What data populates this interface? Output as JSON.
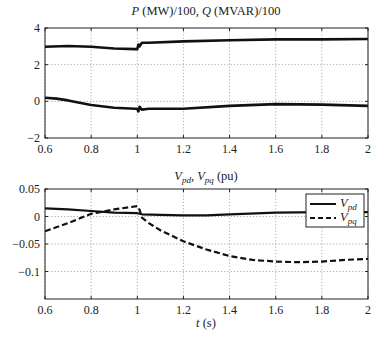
{
  "chart_data": [
    {
      "type": "line",
      "title": "P (MW)/100, Q (MVAR)/100",
      "title_parts": {
        "p": "P",
        "p_rest": " (MW)/100, ",
        "q": "Q",
        "q_rest": " (MVAR)/100"
      },
      "xlabel": "",
      "ylabel": "",
      "xlim": [
        0.6,
        2
      ],
      "ylim": [
        -2,
        4
      ],
      "xticks": [
        "0.6",
        "0.8",
        "1",
        "1.2",
        "1.4",
        "1.6",
        "1.8",
        "2"
      ],
      "yticks": [
        "4",
        "2",
        "0",
        "−2"
      ],
      "grid": true,
      "legend": null,
      "series": [
        {
          "name": "P",
          "style": "solid",
          "x": [
            0.6,
            0.7,
            0.8,
            0.9,
            0.99,
            1.0,
            1.005,
            1.01,
            1.02,
            1.05,
            1.2,
            1.4,
            1.6,
            1.8,
            2.0
          ],
          "values": [
            2.98,
            3.02,
            2.98,
            2.88,
            2.85,
            2.85,
            3.1,
            3.0,
            3.2,
            3.2,
            3.27,
            3.33,
            3.38,
            3.38,
            3.4
          ]
        },
        {
          "name": "Q",
          "style": "solid",
          "x": [
            0.6,
            0.65,
            0.7,
            0.8,
            0.9,
            0.99,
            1.0,
            1.005,
            1.01,
            1.02,
            1.05,
            1.2,
            1.4,
            1.6,
            1.8,
            2.0
          ],
          "values": [
            0.2,
            0.15,
            0.05,
            -0.2,
            -0.35,
            -0.4,
            -0.4,
            -0.55,
            -0.3,
            -0.45,
            -0.4,
            -0.4,
            -0.25,
            -0.15,
            -0.18,
            -0.25
          ]
        }
      ]
    },
    {
      "type": "line",
      "title": "Vpd, Vpq (pu)",
      "title_parts": {
        "v1": "V",
        "s1": "pd",
        "sep": ", ",
        "v2": "V",
        "s2": "pq",
        "rest": " (pu)"
      },
      "xlabel": "t (s)",
      "xlabel_parts": {
        "t": "t",
        "rest": " (s)"
      },
      "ylabel": "",
      "xlim": [
        0.6,
        2
      ],
      "ylim": [
        -0.15,
        0.05
      ],
      "xticks": [
        "0.6",
        "0.8",
        "1",
        "1.2",
        "1.4",
        "1.6",
        "1.8",
        "2"
      ],
      "yticks": [
        "0.05",
        "0",
        "−0.05",
        "−0.1"
      ],
      "grid": true,
      "legend": {
        "position": "upper right",
        "entries": [
          {
            "label_main": "V",
            "label_sub": "pd",
            "style": "solid"
          },
          {
            "label_main": "V",
            "label_sub": "pq",
            "style": "dashed"
          }
        ]
      },
      "series": [
        {
          "name": "Vpd",
          "style": "solid",
          "x": [
            0.6,
            0.7,
            0.8,
            0.9,
            1.0,
            1.02,
            1.1,
            1.2,
            1.3,
            1.4,
            1.6,
            1.8,
            2.0
          ],
          "values": [
            0.015,
            0.013,
            0.01,
            0.007,
            0.006,
            0.004,
            0.003,
            0.002,
            0.002,
            0.004,
            0.007,
            0.008,
            0.008
          ]
        },
        {
          "name": "Vpq",
          "style": "dashed",
          "x": [
            0.6,
            0.7,
            0.8,
            0.9,
            1.0,
            1.01,
            1.02,
            1.05,
            1.1,
            1.2,
            1.3,
            1.4,
            1.5,
            1.6,
            1.7,
            1.8,
            1.9,
            2.0
          ],
          "values": [
            -0.027,
            -0.012,
            0.005,
            0.013,
            0.019,
            0.012,
            -0.002,
            -0.012,
            -0.025,
            -0.045,
            -0.06,
            -0.072,
            -0.079,
            -0.082,
            -0.083,
            -0.082,
            -0.079,
            -0.077
          ]
        }
      ]
    }
  ]
}
